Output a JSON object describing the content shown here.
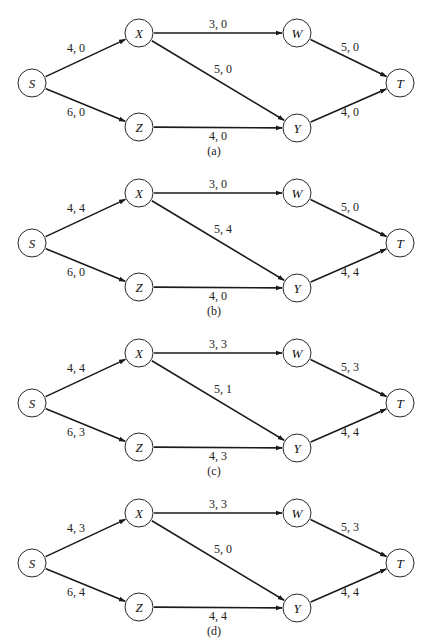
{
  "figure": {
    "node_radius": 14,
    "nodes": [
      {
        "id": "S",
        "label": "S",
        "x": 32,
        "y": 83
      },
      {
        "id": "X",
        "label": "X",
        "x": 139,
        "y": 33
      },
      {
        "id": "W",
        "label": "W",
        "x": 297,
        "y": 33
      },
      {
        "id": "T",
        "label": "T",
        "x": 400,
        "y": 83
      },
      {
        "id": "Z",
        "label": "Z",
        "x": 139,
        "y": 127
      },
      {
        "id": "Y",
        "label": "Y",
        "x": 297,
        "y": 128
      }
    ],
    "edges": [
      {
        "from": "S",
        "to": "X",
        "lx": 76,
        "ly": 52
      },
      {
        "from": "S",
        "to": "Z",
        "lx": 76,
        "ly": 116
      },
      {
        "from": "X",
        "to": "W",
        "lx": 218,
        "ly": 28
      },
      {
        "from": "X",
        "to": "Y",
        "lx": 223,
        "ly": 73
      },
      {
        "from": "Z",
        "to": "Y",
        "lx": 218,
        "ly": 140
      },
      {
        "from": "W",
        "to": "T",
        "lx": 350,
        "ly": 51
      },
      {
        "from": "Y",
        "to": "T",
        "lx": 350,
        "ly": 116
      }
    ],
    "panels": [
      {
        "caption": "(a)",
        "offset_y": 0,
        "labels": [
          "4, 0",
          "6, 0",
          "3, 0",
          "5, 0",
          "4, 0",
          "5, 0",
          "4, 0"
        ]
      },
      {
        "caption": "(b)",
        "offset_y": 160,
        "labels": [
          "4, 4",
          "6, 0",
          "3, 0",
          "5, 4",
          "4, 0",
          "5, 0",
          "4, 4"
        ]
      },
      {
        "caption": "(c)",
        "offset_y": 320,
        "labels": [
          "4, 4",
          "6, 3",
          "3, 3",
          "5, 1",
          "4, 3",
          "5, 3",
          "4, 4"
        ]
      },
      {
        "caption": "(d)",
        "offset_y": 480,
        "labels": [
          "4, 3",
          "6, 4",
          "3, 3",
          "5, 0",
          "4, 4",
          "5, 3",
          "4, 4"
        ]
      }
    ]
  }
}
